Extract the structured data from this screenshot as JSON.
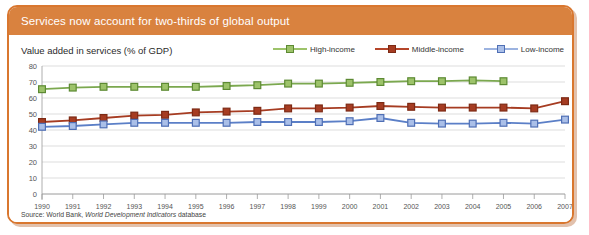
{
  "header": {
    "title": "Services now account for two-thirds of global output",
    "bar_color": "#d9823f"
  },
  "subtitle": "Value added in services (% of GDP)",
  "source": {
    "prefix": "Source: World Bank, ",
    "italic": "World Development Indicators",
    "suffix": " database"
  },
  "legend": {
    "position": "top-right",
    "items": [
      {
        "label": "High-income",
        "color": "#7ba84f",
        "fill": "#9dc36a"
      },
      {
        "label": "Middle-income",
        "color": "#a63c22",
        "fill": "#b5452a"
      },
      {
        "label": "Low-income",
        "color": "#5b7fc7",
        "fill": "#9cb3e0"
      }
    ]
  },
  "chart_data": {
    "type": "line",
    "title": "Services now account for two-thirds of global output",
    "subtitle": "Value added in services (% of GDP)",
    "xlabel": "",
    "ylabel": "",
    "ylim": [
      0,
      80
    ],
    "yticks": [
      0,
      10,
      20,
      30,
      40,
      50,
      60,
      70,
      80
    ],
    "grid": true,
    "legend_position": "top-right",
    "x": [
      1990,
      1991,
      1992,
      1993,
      1994,
      1995,
      1996,
      1997,
      1998,
      1999,
      2000,
      2001,
      2002,
      2003,
      2004,
      2005,
      2006,
      2007
    ],
    "categories": [
      "1990",
      "1991",
      "1992",
      "1993",
      "1994",
      "1995",
      "1996",
      "1997",
      "1998",
      "1999",
      "2000",
      "2001",
      "2002",
      "2003",
      "2004",
      "2005",
      "2006",
      "2007"
    ],
    "series": [
      {
        "name": "High-income",
        "color": "#7ba84f",
        "values": [
          65.5,
          66.5,
          67.0,
          67.0,
          67.0,
          67.0,
          67.5,
          68.0,
          69.0,
          69.0,
          69.5,
          70.0,
          70.5,
          70.5,
          71.0,
          70.5,
          null,
          null
        ]
      },
      {
        "name": "Middle-income",
        "color": "#a63c22",
        "values": [
          45.0,
          46.0,
          47.5,
          49.0,
          49.5,
          51.0,
          51.5,
          52.0,
          53.5,
          53.5,
          54.0,
          55.0,
          54.5,
          54.0,
          54.0,
          54.0,
          53.5,
          58.0
        ]
      },
      {
        "name": "Low-income",
        "color": "#5b7fc7",
        "values": [
          42.0,
          42.5,
          43.5,
          44.5,
          44.5,
          44.5,
          44.5,
          45.0,
          45.0,
          45.0,
          45.5,
          47.5,
          44.5,
          44.0,
          44.0,
          44.5,
          44.0,
          46.5
        ]
      }
    ]
  }
}
